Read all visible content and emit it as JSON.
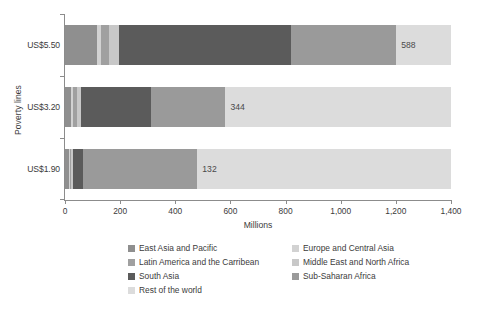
{
  "chart_data": {
    "type": "bar",
    "orientation": "horizontal",
    "stacked": true,
    "title": "",
    "xlabel": "Millions",
    "ylabel": "Poverty lines",
    "categories": [
      "US$5.50",
      "US$3.20",
      "US$1.90"
    ],
    "xlim": [
      0,
      1400
    ],
    "xticks": [
      0,
      200,
      400,
      600,
      800,
      1000,
      1200,
      1400
    ],
    "xticklabels": [
      "0",
      "200",
      "400",
      "600",
      "800",
      "1,000",
      "1,200",
      "1,400"
    ],
    "grid": false,
    "legend_position": "bottom",
    "series": [
      {
        "name": "East Asia and Pacific",
        "color": "#8f8f8f",
        "values": [
          117,
          22,
          14
        ]
      },
      {
        "name": "Europe and Central Asia",
        "color": "#d2d2d2",
        "values": [
          14,
          6,
          3
        ]
      },
      {
        "name": "Latin America and the Carribean",
        "color": "#a0a0a0",
        "values": [
          27,
          15,
          6
        ]
      },
      {
        "name": "Middle East and North Africa",
        "color": "#c8c8c8",
        "values": [
          38,
          14,
          5
        ]
      },
      {
        "name": "South Asia",
        "color": "#5b5b5b",
        "values": [
          622,
          256,
          36
        ]
      },
      {
        "name": "Sub-Saharan Africa",
        "color": "#9a9a9a",
        "values": [
          383,
          269,
          416
        ]
      },
      {
        "name": "Rest of the world",
        "color": "#dcdcdc",
        "values": [
          199,
          818,
          920
        ]
      }
    ],
    "data_labels": [
      {
        "category": "US$5.50",
        "text": "588",
        "value": 588
      },
      {
        "category": "US$3.20",
        "text": "344",
        "value": 344
      },
      {
        "category": "US$1.90",
        "text": "132",
        "value": 132
      }
    ]
  },
  "axis": {
    "x_title": "Millions",
    "y_title": "Poverty lines"
  },
  "legend": {
    "left_column": [
      "East Asia and Pacific",
      "Latin America and the Carribean",
      "South Asia",
      "Rest of the world"
    ],
    "right_column": [
      "Europe and Central Asia",
      "Middle East and North Africa",
      "Sub-Saharan Africa"
    ]
  }
}
